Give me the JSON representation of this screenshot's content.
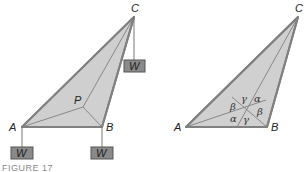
{
  "figure": {
    "caption": "FIGURE 17",
    "colors": {
      "fill": "#d0d0d0",
      "edge": "#808080",
      "inner_line": "#888888",
      "weight_box_fill": "#8a8a8a",
      "weight_box_edge": "#555555",
      "string": "#777777"
    }
  },
  "left_diagram": {
    "vertices": {
      "A": {
        "label": "A",
        "x": 22,
        "y": 127
      },
      "B": {
        "label": "B",
        "x": 102,
        "y": 127
      },
      "C": {
        "label": "C",
        "x": 134,
        "y": 17
      },
      "P": {
        "label": "P",
        "x": 83,
        "y": 107
      }
    },
    "weights": [
      {
        "label": "W",
        "attached_to": "A"
      },
      {
        "label": "W",
        "attached_to": "B"
      },
      {
        "label": "W",
        "attached_to": "C"
      }
    ]
  },
  "right_diagram": {
    "vertices": {
      "A": {
        "label": "A",
        "x": 186,
        "y": 127
      },
      "B": {
        "label": "B",
        "x": 267,
        "y": 127
      },
      "C": {
        "label": "C",
        "x": 298,
        "y": 17
      }
    },
    "angle_labels": [
      {
        "symbol": "γ",
        "position": "top"
      },
      {
        "symbol": "α",
        "position": "top-right"
      },
      {
        "symbol": "β",
        "position": "left"
      },
      {
        "symbol": "β",
        "position": "right"
      },
      {
        "symbol": "α",
        "position": "bottom-left"
      },
      {
        "symbol": "γ",
        "position": "bottom"
      }
    ]
  }
}
